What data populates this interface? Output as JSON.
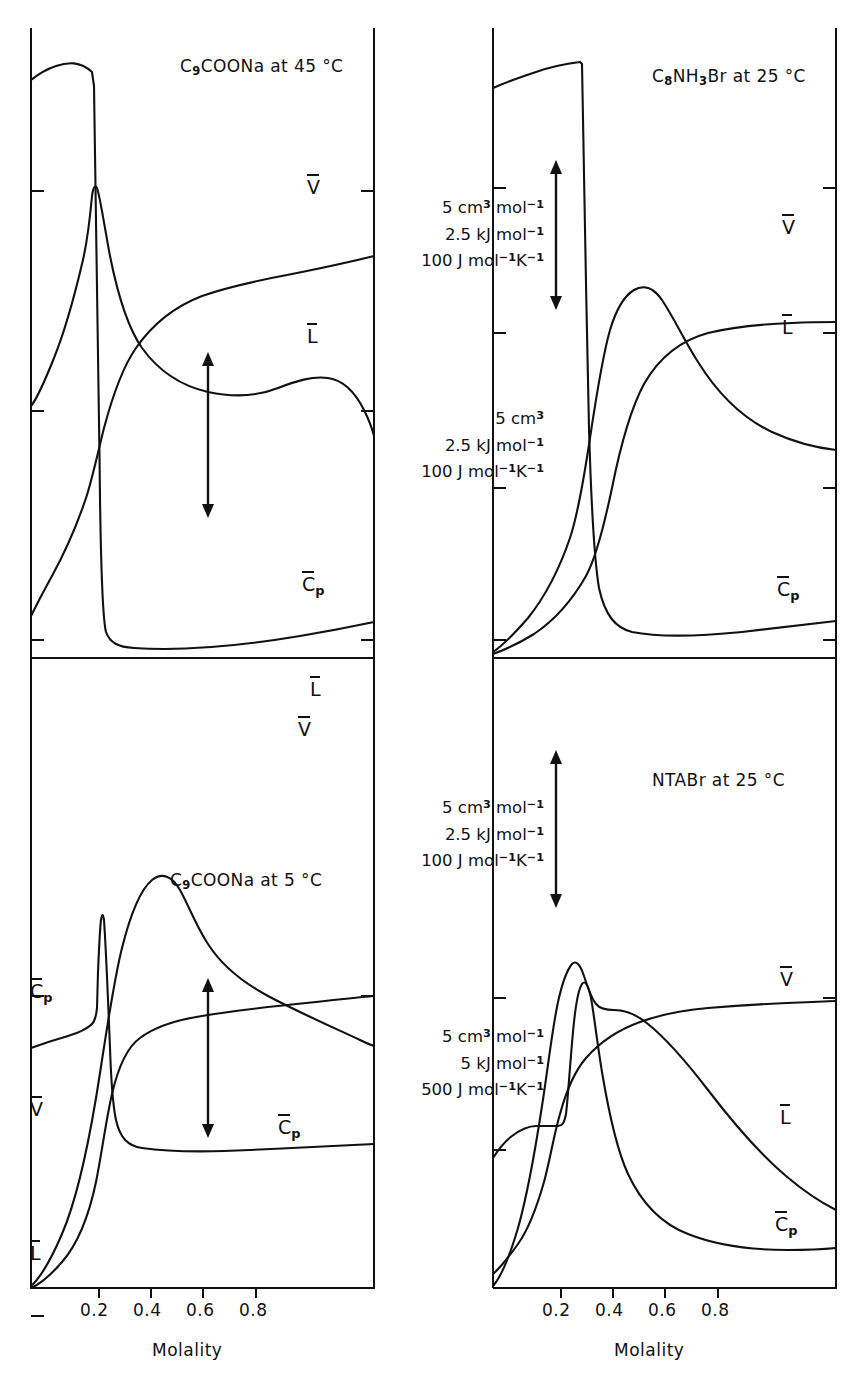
{
  "figure": {
    "axis_label": "Molality",
    "x_ticks": [
      "0.2",
      "0.4",
      "0.6",
      "0.8"
    ]
  },
  "panels": [
    {
      "id": "top-left",
      "title": "C₉COONa at 45 °C",
      "curve_labels": {
        "v": "V",
        "l": "L",
        "cp": "Cₚ"
      }
    },
    {
      "id": "top-right",
      "title": "C₈NH₃Br at 25 °C",
      "curve_labels": {
        "v": "V",
        "l": "L",
        "cp": "Cₚ"
      }
    },
    {
      "id": "bottom-left",
      "title": "C₉COONa at 5 °C",
      "curve_labels": {
        "v": "V",
        "l": "L",
        "cp": "Cₚ"
      }
    },
    {
      "id": "bottom-right",
      "title": "NTABr at 25 °C",
      "curve_labels": {
        "v": "V",
        "l": "L",
        "cp": "Cₚ"
      }
    }
  ],
  "scale_bars": [
    {
      "id": "scale-1",
      "lines": [
        "5 cm³ mol⁻¹",
        "2.5 kJ mol⁻¹",
        "100 J mol⁻¹ K⁻¹"
      ]
    },
    {
      "id": "scale-2",
      "lines": [
        "5 cm³",
        "2.5 kJ mol⁻¹",
        "100 J mol⁻¹ K⁻¹"
      ]
    },
    {
      "id": "scale-3",
      "lines": [
        "5 cm³ mol⁻¹",
        "2.5 kJ mol⁻¹",
        "100 J mol⁻¹ K⁻¹"
      ]
    },
    {
      "id": "scale-4",
      "lines": [
        "5 cm³ mol⁻¹",
        "5 kJ mol⁻¹",
        "500 J mol⁻¹ K⁻¹"
      ]
    }
  ],
  "chart_data": {
    "type": "line",
    "xlabel": "Molality",
    "ylabel": "",
    "xlim": [
      0,
      1.0
    ],
    "grid": false,
    "legend": "inline curve labels",
    "panels": [
      {
        "name": "C₉COONa at 45 °C",
        "series": [
          {
            "name": "V",
            "label": "V̄",
            "description": "partial molar volume: rises steeply near cmc then increases slowly to plateau",
            "x": [
              0.0,
              0.04,
              0.08,
              0.1,
              0.12,
              0.16,
              0.22,
              0.3,
              0.45,
              0.6,
              0.8,
              0.97
            ],
            "y": [
              0.1,
              0.22,
              0.5,
              0.74,
              0.8,
              0.83,
              0.855,
              0.872,
              0.888,
              0.902,
              0.918,
              0.932
            ]
          },
          {
            "name": "L",
            "label": "L̄",
            "description": "relative enthalpy: sharp maximum at cmc then decays with shoulder",
            "x": [
              0.0,
              0.06,
              0.1,
              0.115,
              0.13,
              0.18,
              0.25,
              0.35,
              0.5,
              0.65,
              0.8,
              0.9,
              0.97
            ],
            "y": [
              0.4,
              0.6,
              0.86,
              0.905,
              0.86,
              0.73,
              0.66,
              0.625,
              0.607,
              0.605,
              0.615,
              0.6,
              0.545
            ]
          },
          {
            "name": "Cₚ",
            "label": "C̄ₚ",
            "description": "heat capacity: tall narrow spike at cmc collapsing to low plateau",
            "x": [
              0.0,
              0.02,
              0.06,
              0.09,
              0.105,
              0.115,
              0.125,
              0.14,
              0.18,
              0.3,
              0.55,
              0.8,
              0.97
            ],
            "y": [
              0.97,
              0.965,
              0.95,
              0.93,
              0.6,
              0.18,
              0.08,
              0.045,
              0.035,
              0.038,
              0.046,
              0.058,
              0.072
            ]
          }
        ]
      },
      {
        "name": "C₈NH₃Br at 25 °C",
        "series": [
          {
            "name": "V",
            "label": "V̄",
            "description": "rises sharply near cmc then flat plateau",
            "x": [
              0.0,
              0.08,
              0.15,
              0.2,
              0.24,
              0.28,
              0.33,
              0.4,
              0.55,
              0.75,
              0.97
            ],
            "y": [
              0.05,
              0.12,
              0.26,
              0.48,
              0.68,
              0.745,
              0.765,
              0.772,
              0.775,
              0.775,
              0.775
            ]
          },
          {
            "name": "L",
            "label": "L̄",
            "description": "peak just above cmc then gradual decay",
            "x": [
              0.0,
              0.1,
              0.18,
              0.22,
              0.25,
              0.27,
              0.32,
              0.4,
              0.55,
              0.7,
              0.85,
              0.97
            ],
            "y": [
              0.02,
              0.1,
              0.35,
              0.6,
              0.72,
              0.737,
              0.715,
              0.655,
              0.565,
              0.5,
              0.455,
              0.425
            ]
          },
          {
            "name": "Cₚ",
            "label": "C̄ₚ",
            "description": "high plateau then sharp drop at cmc to low baseline",
            "x": [
              0.0,
              0.04,
              0.1,
              0.17,
              0.2,
              0.215,
              0.23,
              0.26,
              0.32,
              0.45,
              0.65,
              0.85,
              0.97
            ],
            "y": [
              0.93,
              0.955,
              0.945,
              0.935,
              0.8,
              0.45,
              0.22,
              0.13,
              0.085,
              0.062,
              0.055,
              0.058,
              0.063
            ]
          }
        ]
      },
      {
        "name": "C₉COONa at 5 °C",
        "series": [
          {
            "name": "V",
            "label": "V̄",
            "description": "sharp rise at cmc then slow monotone increase",
            "x": [
              0.0,
              0.05,
              0.1,
              0.13,
              0.15,
              0.18,
              0.25,
              0.4,
              0.6,
              0.8,
              0.97
            ],
            "y": [
              0.07,
              0.17,
              0.28,
              0.4,
              0.52,
              0.6,
              0.655,
              0.695,
              0.725,
              0.755,
              0.782
            ]
          },
          {
            "name": "L",
            "label": "L̄",
            "description": "broad maximum near 0.3 then linear decline",
            "x": [
              0.0,
              0.06,
              0.12,
              0.16,
              0.22,
              0.3,
              0.36,
              0.45,
              0.6,
              0.78,
              0.97
            ],
            "y": [
              0.02,
              0.1,
              0.45,
              0.8,
              0.915,
              0.945,
              0.925,
              0.89,
              0.87,
              0.835,
              0.795
            ]
          },
          {
            "name": "Cₚ",
            "label": "C̄ₚ",
            "description": "very narrow tall spike near cmc then flat low baseline",
            "x": [
              0.0,
              0.04,
              0.09,
              0.125,
              0.135,
              0.145,
              0.16,
              0.2,
              0.3,
              0.5,
              0.75,
              0.97
            ],
            "y": [
              0.35,
              0.4,
              0.5,
              0.92,
              0.6,
              0.25,
              0.12,
              0.075,
              0.062,
              0.062,
              0.068,
              0.078
            ]
          }
        ]
      },
      {
        "name": "NTABr at 25 °C",
        "series": [
          {
            "name": "V",
            "label": "V̄",
            "description": "rises at cmc to near-flat plateau, slight decline",
            "x": [
              0.0,
              0.06,
              0.12,
              0.16,
              0.2,
              0.26,
              0.33,
              0.45,
              0.65,
              0.85,
              0.97
            ],
            "y": [
              0.07,
              0.18,
              0.4,
              0.56,
              0.63,
              0.66,
              0.672,
              0.668,
              0.662,
              0.656,
              0.65
            ]
          },
          {
            "name": "L",
            "label": "L̄",
            "description": "narrow peak at cmc with shoulder then steady decline",
            "x": [
              0.0,
              0.08,
              0.14,
              0.165,
              0.18,
              0.2,
              0.24,
              0.28,
              0.33,
              0.45,
              0.62,
              0.8,
              0.97
            ],
            "y": [
              0.03,
              0.16,
              0.55,
              0.745,
              0.72,
              0.695,
              0.69,
              0.665,
              0.63,
              0.545,
              0.45,
              0.375,
              0.315
            ]
          },
          {
            "name": "Cₚ",
            "label": "C̄ₚ",
            "description": "flat plateau, spike, then drop to low baseline",
            "x": [
              0.0,
              0.03,
              0.07,
              0.13,
              0.155,
              0.17,
              0.19,
              0.22,
              0.28,
              0.4,
              0.6,
              0.8,
              0.97
            ],
            "y": [
              0.3,
              0.38,
              0.38,
              0.38,
              0.72,
              0.6,
              0.38,
              0.22,
              0.13,
              0.075,
              0.058,
              0.062,
              0.07
            ]
          }
        ]
      }
    ]
  }
}
